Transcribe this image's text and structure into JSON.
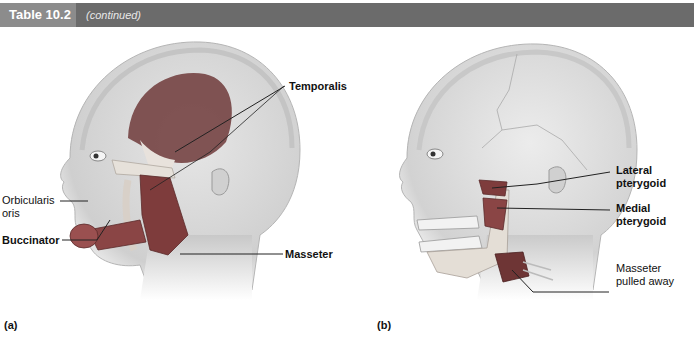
{
  "header": {
    "table_label": "Table 10.2",
    "subtitle": "(continued)",
    "colors": {
      "bar": "#6b6b6b",
      "tab": "#8c8c8c"
    }
  },
  "figures": {
    "a": {
      "panel_label": "(a)",
      "labels": {
        "temporalis": "Temporalis",
        "orbicularis_line1": "Orbicularis",
        "orbicularis_line2": "oris",
        "buccinator": "Buccinator",
        "masseter": "Masseter"
      }
    },
    "b": {
      "panel_label": "(b)",
      "labels": {
        "lateral_line1": "Lateral",
        "lateral_line2": "pterygoid",
        "medial_line1": "Medial",
        "medial_line2": "pterygoid",
        "masseter_pulled_line1": "Masseter",
        "masseter_pulled_line2": "pulled away"
      }
    }
  },
  "colors": {
    "skin": "#d9d9d9",
    "skin_shadow": "#bdbdbd",
    "muscle": "#7a3b3b",
    "muscle_light": "#a86565",
    "leader_line": "#222222"
  }
}
